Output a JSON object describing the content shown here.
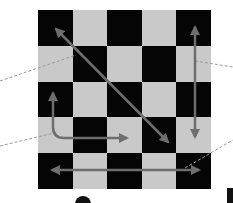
{
  "diagram": {
    "type": "checkerboard-movement-diagram",
    "grid": {
      "rows": 5,
      "cols": 5,
      "pattern_top_left": "dark"
    },
    "colors": {
      "dark_square": "#050505",
      "light_square": "#c9c9c9",
      "arrow": "#6e6e6e",
      "leader_line": "#9a9a9a"
    },
    "arrows": [
      {
        "name": "diagonal-arrow",
        "description": "diagonal movement, both directions",
        "from": "top-left",
        "to": "bottom-right"
      },
      {
        "name": "vertical-arrow",
        "description": "vertical movement, both directions",
        "column": 5
      },
      {
        "name": "l-shaped-arrow",
        "description": "L-shaped movement up and right"
      },
      {
        "name": "horizontal-arrow",
        "description": "horizontal movement, both directions",
        "row": 5
      }
    ],
    "leader_lines": 4
  }
}
